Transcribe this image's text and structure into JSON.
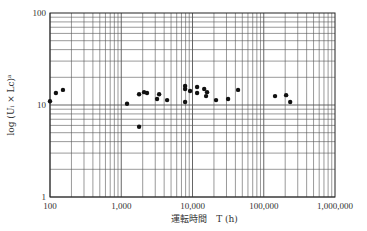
{
  "chart_data": {
    "type": "scatter",
    "title": "",
    "xlabel": "運転時間　T (h)",
    "ylabel": "log (Uᵢ × Lc)ᵃ",
    "xscale": "log",
    "yscale": "log",
    "xlim": [
      100,
      1000000
    ],
    "ylim": [
      1,
      100
    ],
    "grid": true,
    "legend": null,
    "x_ticks": [
      "100",
      "1,000",
      "10,000",
      "100,000",
      "1,000,000"
    ],
    "y_ticks": [
      "1",
      "10",
      "100"
    ],
    "points": [
      {
        "x": 100,
        "y": 11.0
      },
      {
        "x": 121,
        "y": 13.5
      },
      {
        "x": 152,
        "y": 14.6
      },
      {
        "x": 1205,
        "y": 10.3
      },
      {
        "x": 1780,
        "y": 5.8
      },
      {
        "x": 1780,
        "y": 13.1
      },
      {
        "x": 2090,
        "y": 13.8
      },
      {
        "x": 2300,
        "y": 13.5
      },
      {
        "x": 3180,
        "y": 11.6
      },
      {
        "x": 3400,
        "y": 13.1
      },
      {
        "x": 4400,
        "y": 11.3
      },
      {
        "x": 7870,
        "y": 16.1
      },
      {
        "x": 7870,
        "y": 14.9
      },
      {
        "x": 7870,
        "y": 10.8
      },
      {
        "x": 9250,
        "y": 14.2
      },
      {
        "x": 11600,
        "y": 15.7
      },
      {
        "x": 11600,
        "y": 13.5
      },
      {
        "x": 14600,
        "y": 14.9
      },
      {
        "x": 16000,
        "y": 13.8
      },
      {
        "x": 15500,
        "y": 12.5
      },
      {
        "x": 21400,
        "y": 11.3
      },
      {
        "x": 31600,
        "y": 11.6
      },
      {
        "x": 43600,
        "y": 14.6
      },
      {
        "x": 144000,
        "y": 12.5
      },
      {
        "x": 206000,
        "y": 12.8
      },
      {
        "x": 235000,
        "y": 10.8
      }
    ]
  },
  "colors": {
    "grid": "#555555",
    "axis": "#222222",
    "point": "#111111"
  }
}
